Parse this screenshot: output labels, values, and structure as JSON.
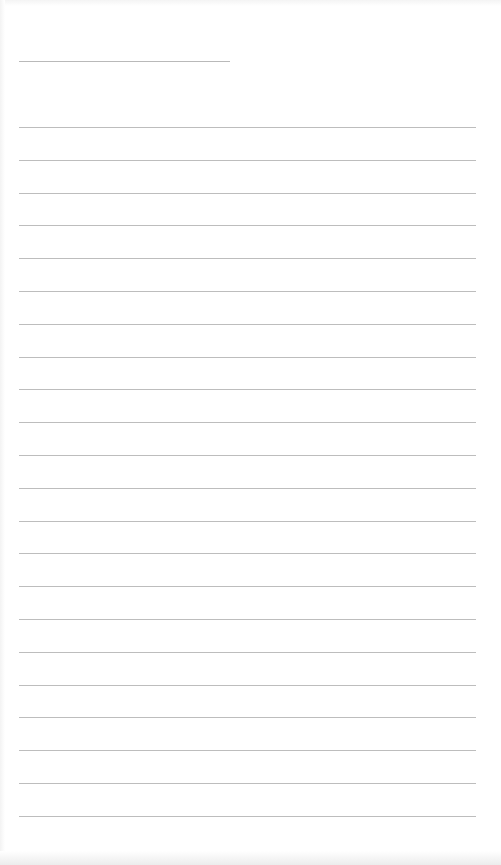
{
  "document": {
    "type": "lined-paper",
    "header_line": {
      "x": 19,
      "y": 61,
      "width": 211,
      "text": ""
    },
    "ruled_lines": {
      "count": 22,
      "start_y": 127,
      "spacing": 32.8,
      "x": 19,
      "width": 457,
      "entries": [
        "",
        "",
        "",
        "",
        "",
        "",
        "",
        "",
        "",
        "",
        "",
        "",
        "",
        "",
        "",
        "",
        "",
        "",
        "",
        "",
        "",
        ""
      ]
    },
    "colors": {
      "paper": "#ffffff",
      "line": "#bdbdbd",
      "edge_shadow": "#ececec"
    }
  }
}
